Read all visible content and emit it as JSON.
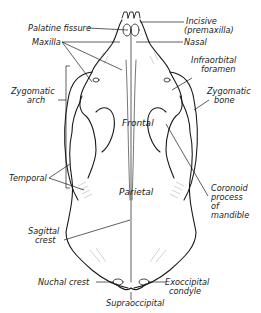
{
  "figure": {
    "labels": {
      "palatine_fissure": "Palatine fissure",
      "maxilla": "Maxilla",
      "zygomatic_arch_1": "Zygomatic",
      "zygomatic_arch_2": "arch",
      "temporal": "Temporal",
      "incisive_1": "Incisive",
      "incisive_2": "(premaxilla)",
      "nasal": "Nasal",
      "infraorbital_1": "Infraorbital",
      "infraorbital_2": "foramen",
      "zygomatic_bone_1": "Zygomatic",
      "zygomatic_bone_2": "bone",
      "frontal": "Frontal",
      "parietal": "Parietal",
      "coronoid_1": "Coronoid",
      "coronoid_2": "process",
      "coronoid_3": "of",
      "coronoid_4": "mandible",
      "sagittal_1": "Sagittal",
      "sagittal_2": "crest",
      "nuchal_crest": "Nuchal crest",
      "exoccipital_1": "Exoccipital",
      "exoccipital_2": "condyle",
      "supraoccipital": "Supraoccipital"
    },
    "colors": {
      "line": "#1a1a1a",
      "hatch": "#8a8a8a",
      "background": "#ffffff"
    }
  }
}
